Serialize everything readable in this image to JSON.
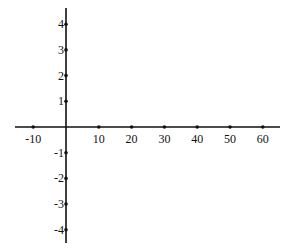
{
  "chart_data": {
    "type": "line",
    "title": "",
    "xlabel": "",
    "ylabel": "",
    "grid": false,
    "xlim": [
      -10,
      60
    ],
    "ylim": [
      -4,
      4
    ],
    "x_ticks": [
      -10,
      10,
      20,
      30,
      40,
      50,
      60
    ],
    "x_tick_labels": [
      "-10",
      "10",
      "20",
      "30",
      "40",
      "50",
      "60"
    ],
    "y_ticks": [
      4,
      3,
      2,
      1,
      -1,
      -2,
      -3,
      -4
    ],
    "y_tick_labels": [
      "4",
      "3",
      "2",
      "1",
      "-1",
      "-2",
      "-3",
      "-4"
    ],
    "series": []
  },
  "layout": {
    "origin_px": [
      66,
      127
    ],
    "x_unit_px": 3.28,
    "y_unit_px": 25.7,
    "x_axis_px": [
      15,
      280
    ],
    "y_axis_px": [
      8,
      243
    ]
  }
}
